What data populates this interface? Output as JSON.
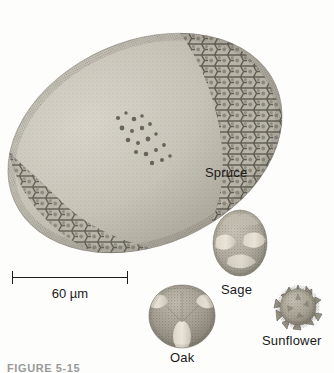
{
  "figure": {
    "caption": "FIGURE 5-15",
    "scale_bar": {
      "label": "60 µm",
      "value": 60,
      "unit": "µm",
      "length_px": 116
    },
    "background_color": "#fdfdfc",
    "ink_color": "#1d1d1d"
  },
  "specimens": [
    {
      "name": "spruce",
      "label": "Spruce",
      "shape": "bisaccate-ellipse",
      "surface": "stippled with reticulate margin",
      "relative_size": "largest",
      "label_x": 205,
      "label_y": 166,
      "tone": "#bdb9ae"
    },
    {
      "name": "sage",
      "label": "Sage",
      "shape": "spheroidal with furrows",
      "surface": "punctate",
      "relative_size": "medium",
      "label_x": 221,
      "label_y": 283,
      "tone": "#b3aea1"
    },
    {
      "name": "oak",
      "label": "Oak",
      "shape": "rounded-triangular",
      "surface": "finely granular with pale colpi",
      "relative_size": "medium",
      "label_x": 170,
      "label_y": 351,
      "tone": "#a9a396"
    },
    {
      "name": "sunflower",
      "label": "Sunflower",
      "shape": "echinate sphere",
      "surface": "spiny",
      "relative_size": "smallest",
      "label_x": 262,
      "label_y": 334,
      "tone": "#b0aa9c"
    }
  ]
}
